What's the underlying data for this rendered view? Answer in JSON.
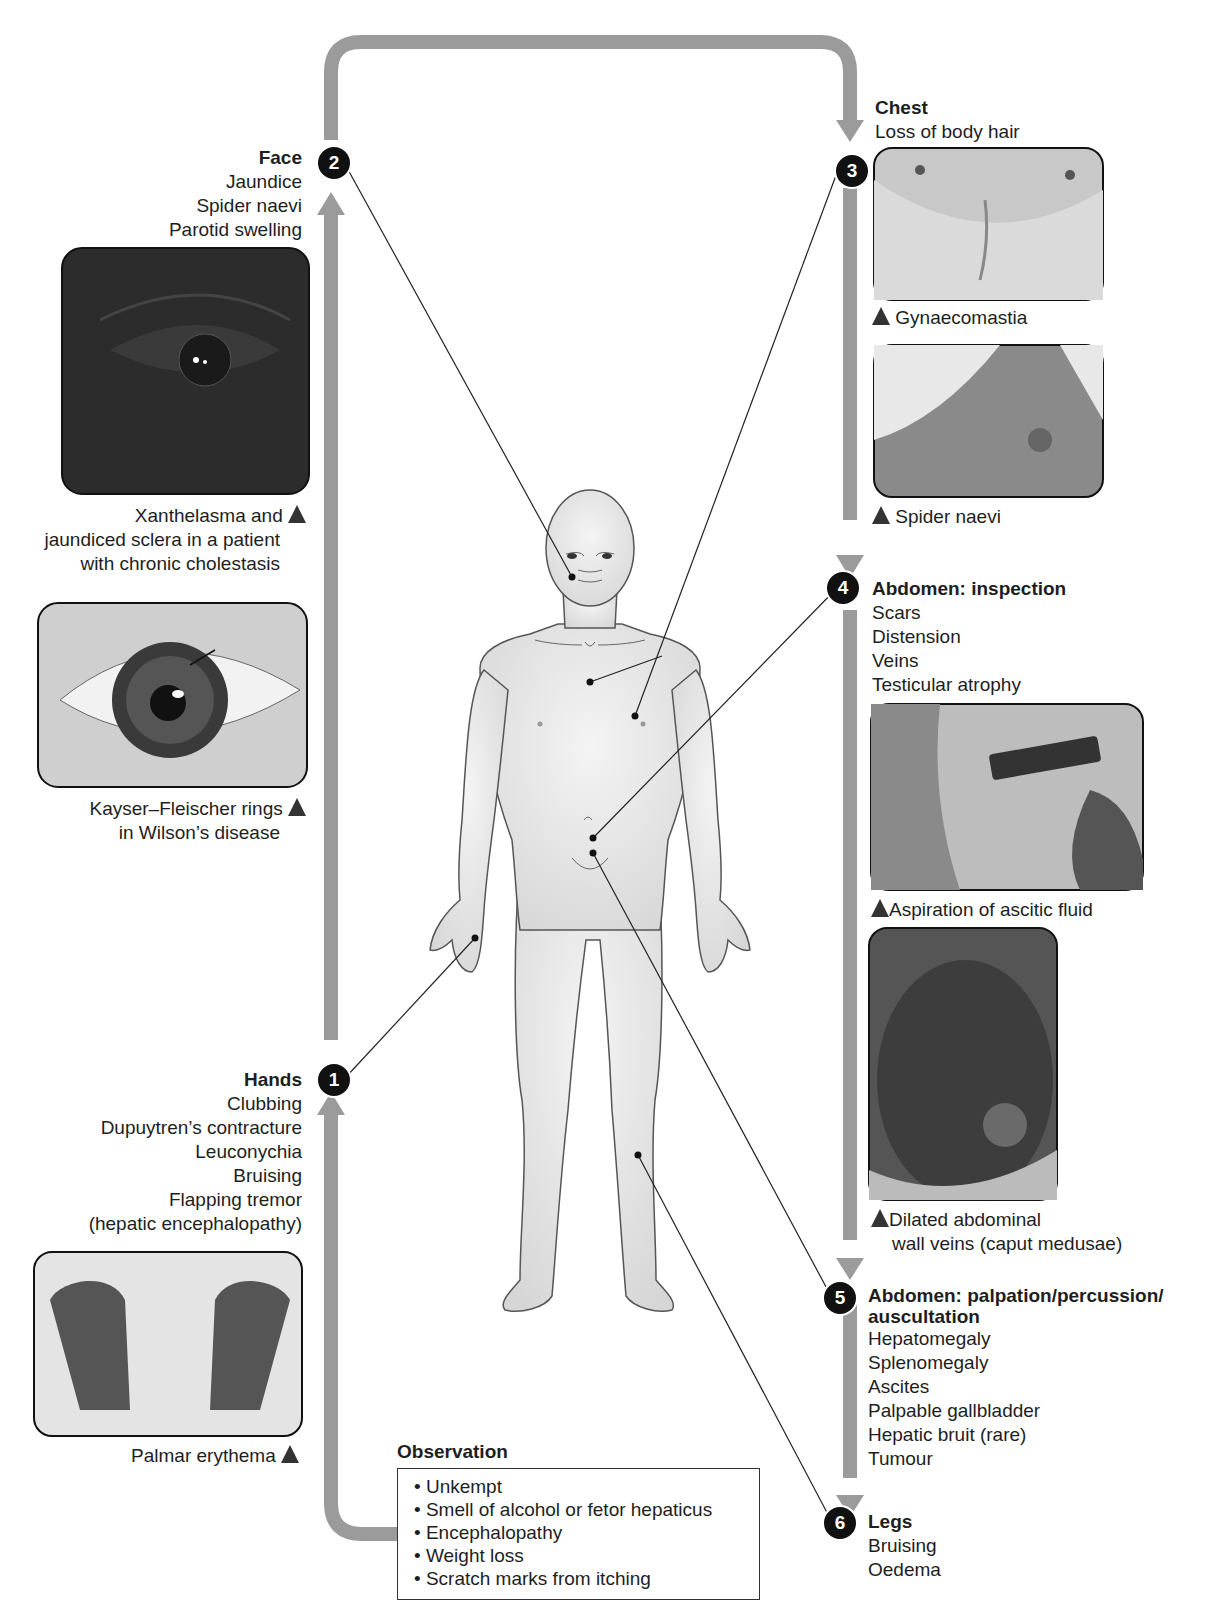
{
  "steps": {
    "face": {
      "number": "2",
      "title": "Face",
      "items": [
        "Jaundice",
        "Spider naevi",
        "Parotid swelling"
      ]
    },
    "hands": {
      "number": "1",
      "title": "Hands",
      "items": [
        "Clubbing",
        "Dupuytren’s contracture",
        "Leuconychia",
        "Bruising",
        "Flapping tremor",
        "(hepatic encephalopathy)"
      ]
    },
    "chest": {
      "number": "3",
      "title": "Chest",
      "items": [
        "Loss of body hair"
      ]
    },
    "abdomen_inspection": {
      "number": "4",
      "title": "Abdomen: inspection",
      "items": [
        "Scars",
        "Distension",
        "Veins",
        "Testicular atrophy"
      ]
    },
    "abdomen_palpation": {
      "number": "5",
      "title_line1": "Abdomen: palpation/percussion/",
      "title_line2": "auscultation",
      "items": [
        "Hepatomegaly",
        "Splenomegaly",
        "Ascites",
        "Palpable gallbladder",
        "Hepatic bruit (rare)",
        "Tumour"
      ]
    },
    "legs": {
      "number": "6",
      "title": "Legs",
      "items": [
        "Bruising",
        "Oedema"
      ]
    }
  },
  "photos": {
    "xanthelasma": {
      "caption_lines": [
        "Xanthelasma and",
        "jaundiced sclera in a patient",
        "with chronic cholestasis"
      ]
    },
    "kayser": {
      "caption_lines": [
        "Kayser–Fleischer rings",
        "in Wilson’s disease"
      ]
    },
    "palmar": {
      "caption_lines": [
        "Palmar erythema"
      ]
    },
    "gynaecomastia": {
      "caption_lines": [
        "Gynaecomastia"
      ]
    },
    "spider": {
      "caption_lines": [
        "Spider naevi"
      ]
    },
    "ascitic": {
      "caption_lines": [
        "Aspiration of ascitic fluid"
      ]
    },
    "caput": {
      "caption_lines": [
        "Dilated abdominal",
        "wall veins (caput medusae)"
      ]
    }
  },
  "observation": {
    "title": "Observation",
    "items": [
      "• Unkempt",
      "• Smell of alcohol or fetor hepaticus",
      "• Encephalopathy",
      "• Weight loss",
      "• Scratch marks from itching"
    ]
  },
  "colors": {
    "arrow": "#9b9b9b",
    "badge": "#111111",
    "body_fill": "#e6e6e6"
  }
}
